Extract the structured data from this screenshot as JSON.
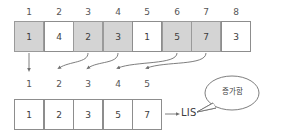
{
  "diagram": {
    "top_indices": [
      "1",
      "2",
      "3",
      "4",
      "5",
      "6",
      "7",
      "8"
    ],
    "top_values": [
      "1",
      "4",
      "2",
      "3",
      "1",
      "5",
      "7",
      "3"
    ],
    "top_selected": [
      true,
      false,
      true,
      true,
      false,
      true,
      true,
      false
    ],
    "middle_indices": [
      "1",
      "2",
      "3",
      "4",
      "5"
    ],
    "bottom_values": [
      "1",
      "2",
      "3",
      "5",
      "7"
    ],
    "result_label": "LIS",
    "bubble_note": "증가함",
    "colors": {
      "shaded_cell": "#d4d4d4",
      "cell_border": "#8d8d8d",
      "plain_cell": "#ffffff",
      "text": "#3d3d3d",
      "stroke": "#6f6f6f",
      "background": "#ffffff"
    }
  }
}
